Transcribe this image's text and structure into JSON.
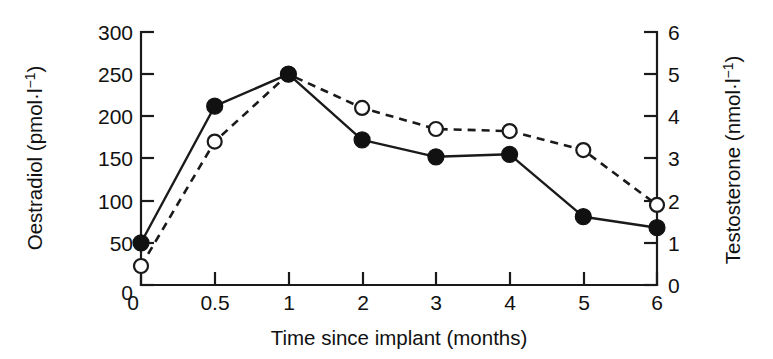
{
  "chart_data": {
    "type": "line",
    "title": "",
    "subtitle": "",
    "xlabel": "Time since implant (months)",
    "ylabel": "Oestradiol (pmol·l⁻¹)",
    "y2label": "Testosterone (nmol·l⁻¹)",
    "categories": [
      "0",
      "0.5",
      "1",
      "2",
      "3",
      "4",
      "5",
      "6"
    ],
    "x_tick_labels": [
      "0",
      "0.5",
      "1",
      "2",
      "3",
      "4",
      "5",
      "6"
    ],
    "y_tick_labels": [
      "0",
      "50",
      "100",
      "150",
      "200",
      "250",
      "300"
    ],
    "y_ticks": [
      0,
      50,
      100,
      150,
      200,
      250,
      300
    ],
    "ylim": [
      0,
      300
    ],
    "y2_tick_labels": [
      "0",
      "1",
      "2",
      "3",
      "4",
      "5",
      "6"
    ],
    "y2_ticks": [
      0,
      1,
      2,
      3,
      4,
      5,
      6
    ],
    "y2lim": [
      0,
      6
    ],
    "grid": false,
    "legend": "none",
    "series": [
      {
        "name": "Oestradiol",
        "axis": "left",
        "marker": "filled-circle",
        "line": "solid",
        "units": "pmol·l⁻¹",
        "values": [
          50,
          212,
          250,
          172,
          152,
          155,
          81,
          68
        ]
      },
      {
        "name": "Testosterone",
        "axis": "right",
        "marker": "open-circle",
        "line": "dashed",
        "units": "nmol·l⁻¹",
        "values": [
          0.45,
          3.4,
          5.0,
          4.2,
          3.7,
          3.65,
          3.2,
          1.9
        ]
      }
    ],
    "colors": {
      "axis": "#1a1a1a",
      "oestradiol_line": "#1a1a1a",
      "testosterone_line": "#1a1a1a",
      "background": "#ffffff"
    }
  },
  "axes": {
    "left_title_main": "Oestradiol (pmol·l",
    "left_title_sup": "−1",
    "left_title_tail": ")",
    "right_title_main": "Testosterone (nmol·l",
    "right_title_sup": "−1",
    "right_title_tail": ")",
    "x_title": "Time since implant (months)"
  }
}
